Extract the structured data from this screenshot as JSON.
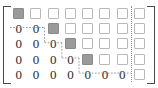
{
  "figure": {
    "kind": "augmented-matrix-row-echelon-diagram",
    "bracket_left": "[",
    "bracket_right": "]",
    "rows": 5,
    "columns": 8,
    "coefficient_columns": 7,
    "augmented_columns": 1,
    "augmented_separator": "vertical-dotted-line",
    "staircase": "dotted-step-boundary",
    "zero_glyph": "0",
    "colors": {
      "pivot_fill": "#9a9a9a",
      "pivot_border": "#8a8a8a",
      "box_border": "#b9b9b9",
      "box_fill": "#ffffff",
      "bracket": "#4a4a4a",
      "zero_text": "#2b2b2b",
      "dotted_line": "#8f8f8f",
      "background": "#ffffff"
    }
  },
  "matrix": {
    "cells": [
      [
        {
          "type": "pivot",
          "text": ""
        },
        {
          "type": "box",
          "text": ""
        },
        {
          "type": "box",
          "text": ""
        },
        {
          "type": "box",
          "text": ""
        },
        {
          "type": "box",
          "text": ""
        },
        {
          "type": "box",
          "text": ""
        },
        {
          "type": "box",
          "text": ""
        },
        {
          "type": "box",
          "text": ""
        }
      ],
      [
        {
          "type": "zero",
          "text": "0"
        },
        {
          "type": "zero",
          "text": "0"
        },
        {
          "type": "pivot",
          "text": ""
        },
        {
          "type": "box",
          "text": ""
        },
        {
          "type": "box",
          "text": ""
        },
        {
          "type": "box",
          "text": ""
        },
        {
          "type": "box",
          "text": ""
        },
        {
          "type": "box",
          "text": ""
        }
      ],
      [
        {
          "type": "zero",
          "text": "0"
        },
        {
          "type": "zero",
          "text": "0"
        },
        {
          "type": "zero",
          "text": "0"
        },
        {
          "type": "pivot",
          "text": ""
        },
        {
          "type": "box",
          "text": ""
        },
        {
          "type": "box",
          "text": ""
        },
        {
          "type": "box",
          "text": ""
        },
        {
          "type": "box",
          "text": ""
        }
      ],
      [
        {
          "type": "zero",
          "text": "0"
        },
        {
          "type": "zero",
          "text": "0"
        },
        {
          "type": "zero",
          "text": "0"
        },
        {
          "type": "zero",
          "text": "0"
        },
        {
          "type": "pivot",
          "text": ""
        },
        {
          "type": "box",
          "text": ""
        },
        {
          "type": "box",
          "text": ""
        },
        {
          "type": "box",
          "text": ""
        }
      ],
      [
        {
          "type": "zero",
          "text": "0"
        },
        {
          "type": "zero",
          "text": "0"
        },
        {
          "type": "zero",
          "text": "0"
        },
        {
          "type": "zero",
          "text": "0"
        },
        {
          "type": "zero",
          "text": "0"
        },
        {
          "type": "zero",
          "text": "0"
        },
        {
          "type": "zero",
          "text": "0"
        },
        {
          "type": "box",
          "text": ""
        }
      ]
    ]
  }
}
